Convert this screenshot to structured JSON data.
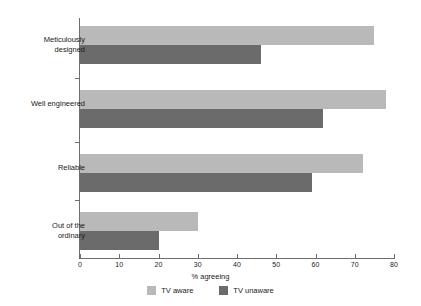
{
  "chart_data": {
    "type": "bar",
    "orientation": "horizontal",
    "title": "",
    "xlabel": "% agreeing",
    "ylabel": "",
    "xlim": [
      0,
      80
    ],
    "xticks": [
      0,
      10,
      20,
      30,
      40,
      50,
      60,
      70,
      80
    ],
    "grid": false,
    "legend_position": "bottom-center",
    "categories": [
      "Meticulously designed",
      "Well engineered",
      "Reliable",
      "Out of the ordinary"
    ],
    "category_labels_display": [
      "Meticulously\ndesigned",
      "Well engineered",
      "Reliable",
      "Out of the\nordinary"
    ],
    "series": [
      {
        "name": "TV aware",
        "color": "#b9b9b9",
        "values": [
          75,
          78,
          72,
          30
        ]
      },
      {
        "name": "TV unaware",
        "color": "#6b6b6b",
        "values": [
          46,
          62,
          59,
          20
        ]
      }
    ]
  },
  "axis": {
    "x_title": "% agreeing",
    "tick_labels": [
      "0",
      "10",
      "20",
      "30",
      "40",
      "50",
      "60",
      "70",
      "80"
    ]
  },
  "legend": {
    "items": [
      {
        "label": "TV aware",
        "color": "#b9b9b9"
      },
      {
        "label": "TV unaware",
        "color": "#6b6b6b"
      }
    ]
  },
  "colors": {
    "aware": "#b9b9b9",
    "unaware": "#6b6b6b",
    "axis": "#6e6e6e",
    "text": "#1a1a1a",
    "background": "#ffffff"
  }
}
